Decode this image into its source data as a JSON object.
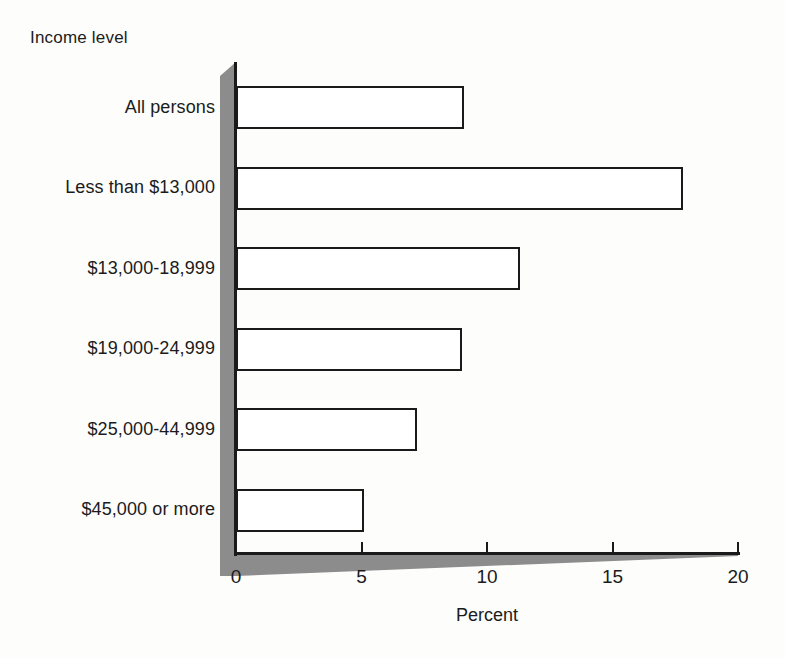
{
  "chart_data": {
    "type": "bar",
    "orientation": "horizontal",
    "title": "",
    "xlabel": "Percent",
    "ylabel": "Income level",
    "categories": [
      "All persons",
      "Less than $13,000",
      "$13,000-18,999",
      "$19,000-24,999",
      "$25,000-44,999",
      "$45,000 or more"
    ],
    "values": [
      9.1,
      17.8,
      11.3,
      9.0,
      7.2,
      5.1
    ],
    "xlim": [
      0,
      20
    ],
    "xticks": [
      0,
      5,
      10,
      15,
      20
    ],
    "xtick_labels": [
      "0",
      "5",
      "10",
      "15",
      "20"
    ],
    "grid": false,
    "legend": null,
    "bar_face_color": "#ffffff",
    "bar_edge_color": "#1a1a1a",
    "axis_shadow_color": "#8c8c8c",
    "background_color": "#fdfdfc"
  },
  "axis": {
    "y_heading": "Income level",
    "x_title": "Percent"
  }
}
